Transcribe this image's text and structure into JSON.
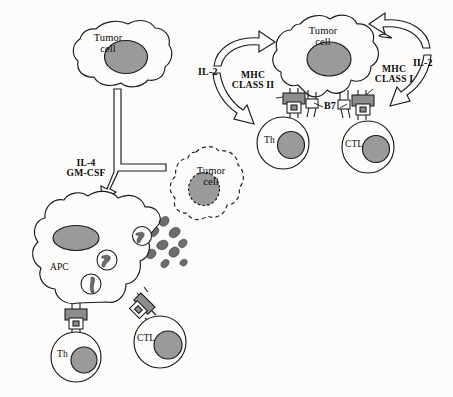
{
  "figure": {
    "kind": "immunology-schematic",
    "background_color": "#fdfcfa",
    "ink_color": "#1a1a1a",
    "nucleus_color": "#9a9a9a",
    "fragment_color": "#6d6d6d"
  },
  "labels": {
    "tumor_cell_top_left": "Tumor\ncell",
    "tumor_cell_top_right": "Tumor\ncell",
    "tumor_cell_dashed": "Tumor\ncell",
    "cytokines": "IL-4\nGM-CSF",
    "il2_left": "IL-2",
    "il2_right": "IL-2",
    "mhc_class_ii": "MHC\nCLASS II",
    "mhc_class_i": "MHC\nCLASS I",
    "b7": "B7",
    "apc": "APC",
    "th_top": "Th",
    "ctl_top": "CTL",
    "th_bottom": "Th",
    "ctl_bottom": "CTL"
  },
  "cells": [
    {
      "id": "tumor-cell-top-left",
      "name": "Tumor cell",
      "label": "Tumor\ncell",
      "style": "solid",
      "shape": "amoeboid",
      "has_nucleus": true
    },
    {
      "id": "tumor-cell-top-right",
      "name": "Tumor cell",
      "label": "Tumor\ncell",
      "style": "solid",
      "shape": "amoeboid",
      "has_nucleus": true
    },
    {
      "id": "tumor-cell-dashed",
      "name": "Tumor cell (lysed, dashed outline)",
      "label": "Tumor\ncell",
      "style": "dashed",
      "shape": "amoeboid",
      "has_nucleus": true
    },
    {
      "id": "apc",
      "name": "Antigen presenting cell",
      "label": "APC",
      "style": "solid",
      "shape": "stellate",
      "has_nucleus": true,
      "vesicle_count": 3
    },
    {
      "id": "th-top",
      "name": "Helper T cell (top)",
      "label": "Th",
      "style": "solid",
      "shape": "round",
      "has_nucleus": true
    },
    {
      "id": "ctl-top",
      "name": "Cytotoxic T lymphocyte (top)",
      "label": "CTL",
      "style": "solid",
      "shape": "round",
      "has_nucleus": true
    },
    {
      "id": "th-bottom",
      "name": "Helper T cell (bottom)",
      "label": "Th",
      "style": "solid",
      "shape": "round",
      "has_nucleus": true
    },
    {
      "id": "ctl-bottom",
      "name": "Cytotoxic T lymphocyte (bottom)",
      "label": "CTL",
      "style": "solid",
      "shape": "round",
      "has_nucleus": true
    }
  ],
  "annotations": [
    {
      "id": "mhc-class-ii",
      "text": "MHC\nCLASS II",
      "bold": true,
      "has_leader": true
    },
    {
      "id": "mhc-class-i",
      "text": "MHC\nCLASS I",
      "bold": true,
      "has_leader": true
    },
    {
      "id": "b7",
      "text": "B7",
      "bold": true,
      "has_leader": true
    },
    {
      "id": "il2-left",
      "text": "IL-2",
      "bold": true,
      "has_leader": false
    },
    {
      "id": "il2-right",
      "text": "IL-2",
      "bold": true,
      "has_leader": false
    },
    {
      "id": "cytokines",
      "text": "IL-4\nGM-CSF",
      "bold": true,
      "has_leader": false
    }
  ],
  "arrows": [
    {
      "id": "il2-arrow-left",
      "style": "hollow-curved",
      "label": "IL-2",
      "from": "th-top",
      "to": "th-top"
    },
    {
      "id": "il2-arrow-right",
      "style": "hollow-curved",
      "label": "IL-2",
      "from": "ctl-top",
      "to": "ctl-top"
    },
    {
      "id": "cytokine-arrow",
      "style": "hollow-forked",
      "label": "IL-4 GM-CSF",
      "from": "tumor-cell-top-left",
      "to": "apc"
    }
  ]
}
